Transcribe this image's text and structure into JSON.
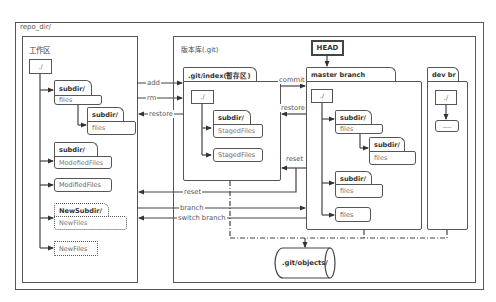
{
  "repo": {
    "title": "repo_dir/"
  },
  "working_area": {
    "title": "工作区",
    "root": "./",
    "items": [
      {
        "type": "folder",
        "name": "subdir/",
        "content": "files"
      },
      {
        "type": "folder",
        "name": "subdir/",
        "content": "files"
      },
      {
        "type": "folder",
        "name": "subdir/",
        "content": "ModefiedFiles"
      },
      {
        "type": "file",
        "name": "ModifiedFiles"
      },
      {
        "type": "folder-new",
        "name": "NewSubdir/",
        "content": "NewFiles"
      },
      {
        "type": "file-new",
        "name": "NewFiles"
      }
    ]
  },
  "repository": {
    "title": "版本库(.git)",
    "index": {
      "tab": ".git/index(暂存区)",
      "root": "./",
      "folder": {
        "name": "subdir/",
        "content": "StagedFiles"
      },
      "file": "StagedFiles"
    },
    "head": "HEAD",
    "master": {
      "tab": "master branch",
      "root": "./",
      "items": [
        {
          "name": "subdir/",
          "content": "files"
        },
        {
          "name": "subdir/",
          "content": "files"
        },
        {
          "name": "subdir/",
          "content": "files"
        },
        {
          "file": "files"
        }
      ]
    },
    "dev": {
      "tab": "dev br",
      "root": "./",
      "placeholder": "----"
    },
    "objects": ".git/objects/"
  },
  "arrows": {
    "add": "add",
    "rm": "rm",
    "restore_work": "restore",
    "commit": "commit",
    "restore_index": "restore",
    "reset_index": "reset",
    "reset_work": "reset",
    "branch": "branch",
    "switch_branch": "switch branch"
  }
}
